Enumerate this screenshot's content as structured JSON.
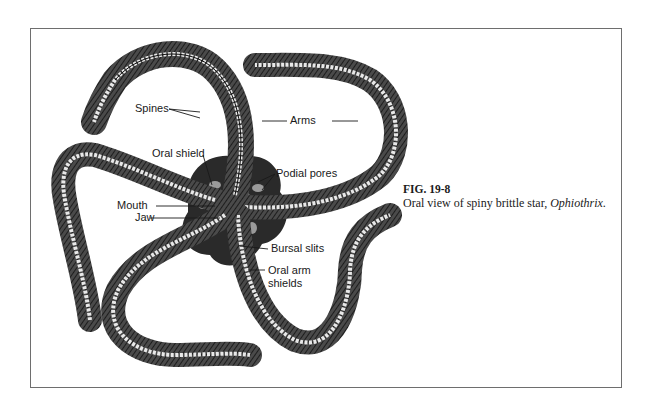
{
  "figure": {
    "number": "FIG. 19-8",
    "caption_prefix": "Oral view of spiny brittle star, ",
    "caption_genus": "Ophiothrix",
    "caption_suffix": "."
  },
  "labels": {
    "spines": "Spines",
    "arms": "Arms",
    "oral_shield": "Oral shield",
    "podial_pores": "Podial pores",
    "mouth": "Mouth",
    "jaw": "Jaw",
    "bursal_slits": "Bursal slits",
    "oral_arm_shields_line1": "Oral arm",
    "oral_arm_shields_line2": "shields"
  },
  "colors": {
    "ink": "#1a1a1a",
    "arm_fill": "#3a3a3a",
    "ossicle": "#e8e8e8",
    "frame": "#6e6e6e",
    "background": "#ffffff"
  }
}
